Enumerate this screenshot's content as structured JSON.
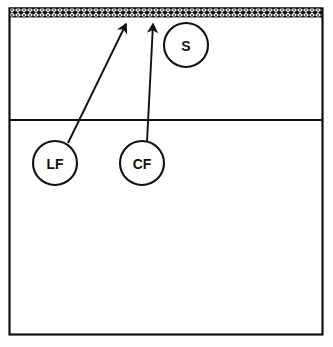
{
  "diagram": {
    "background_color": "#ffffff",
    "line_color": "#111111",
    "court": {
      "outline": {
        "x": 9,
        "y": 8,
        "width": 314,
        "height": 327
      },
      "attack_line_y": 120,
      "net_band": {
        "x": 9,
        "y": 8,
        "width": 314,
        "height": 9,
        "pattern": "checkerboard-net"
      }
    },
    "players": [
      {
        "id": "LF",
        "label": "LF",
        "name": "left-front",
        "cx": 55,
        "cy": 163,
        "r": 22
      },
      {
        "id": "CF",
        "label": "CF",
        "name": "center-front",
        "cx": 142,
        "cy": 163,
        "r": 22
      },
      {
        "id": "S",
        "label": "S",
        "name": "setter",
        "cx": 186,
        "cy": 45,
        "r": 22
      }
    ],
    "arrows": [
      {
        "id": "lf-attack",
        "from_player": "LF",
        "x1": 68,
        "y1": 143,
        "x2": 126,
        "y2": 24
      },
      {
        "id": "cf-attack",
        "from_player": "CF",
        "x1": 147,
        "y1": 142,
        "x2": 153,
        "y2": 24
      }
    ]
  }
}
